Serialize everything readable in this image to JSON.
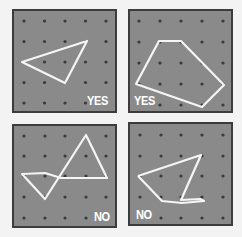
{
  "grid": {
    "rows": 5,
    "cols": 5,
    "dot_color": "#3a3a3a",
    "band_color": "#f5f5f5",
    "board_color": "#8a8a8a",
    "border_color": "#3c3c3c"
  },
  "panels": [
    {
      "id": "top-left",
      "label": "YES",
      "convex": true,
      "shape": [
        [
          0,
          2
        ],
        [
          3,
          1
        ],
        [
          2,
          3
        ]
      ]
    },
    {
      "id": "top-right",
      "label": "YES",
      "convex": true,
      "shape": [
        [
          1,
          1
        ],
        [
          2,
          1
        ],
        [
          4,
          3
        ],
        [
          3,
          4
        ],
        [
          0,
          3
        ]
      ]
    },
    {
      "id": "bottom-left",
      "label": "NO",
      "convex": false,
      "shape": [
        [
          0,
          2
        ],
        [
          1,
          2
        ],
        [
          4,
          2
        ],
        [
          3,
          0
        ],
        [
          1,
          3
        ]
      ]
    },
    {
      "id": "bottom-right",
      "label": "NO",
      "convex": false,
      "shape": [
        [
          0,
          2
        ],
        [
          3,
          1
        ],
        [
          2,
          3
        ],
        [
          3,
          3
        ],
        [
          1,
          3
        ]
      ]
    }
  ]
}
